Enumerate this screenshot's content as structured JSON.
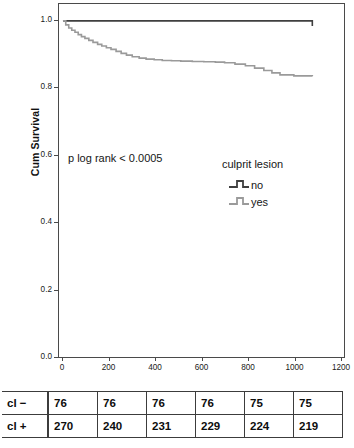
{
  "chart_data": {
    "type": "line",
    "title": "",
    "subtitle": "",
    "xlabel": "",
    "ylabel": "Cum Survival",
    "xlim": [
      0,
      1200
    ],
    "ylim": [
      0.0,
      1.0
    ],
    "x_ticks": [
      0,
      200,
      400,
      600,
      800,
      1000,
      1200
    ],
    "x_tick_labels": [
      "0",
      "200",
      "400",
      "600",
      "800",
      "1000",
      "1200"
    ],
    "y_ticks": [
      0.0,
      0.2,
      0.4,
      0.6,
      0.8,
      1.0
    ],
    "y_tick_labels": [
      "0.0",
      "0.2",
      "0.4",
      "0.6",
      "0.8",
      "1.0"
    ],
    "grid": false,
    "legend_position": "center-right",
    "legend_title": "culprit lesion",
    "annotation": "p log rank < 0.0005",
    "series": [
      {
        "name": "no",
        "color": "#3f3f3f",
        "step": "post",
        "x": [
          0,
          30,
          740,
          1080
        ],
        "y": [
          1.0,
          1.0,
          1.0,
          0.985
        ]
      },
      {
        "name": "yes",
        "color": "#9a9a9a",
        "step": "post",
        "x": [
          0,
          12,
          25,
          38,
          52,
          66,
          80,
          95,
          112,
          130,
          150,
          168,
          188,
          208,
          230,
          252,
          275,
          300,
          330,
          360,
          395,
          430,
          470,
          510,
          560,
          610,
          660,
          700,
          745,
          790,
          830,
          870,
          905,
          940,
          1000,
          1080
        ],
        "y": [
          1.0,
          0.988,
          0.979,
          0.972,
          0.966,
          0.959,
          0.953,
          0.948,
          0.942,
          0.936,
          0.93,
          0.925,
          0.92,
          0.915,
          0.909,
          0.903,
          0.898,
          0.893,
          0.889,
          0.886,
          0.884,
          0.882,
          0.881,
          0.88,
          0.879,
          0.878,
          0.877,
          0.875,
          0.871,
          0.866,
          0.859,
          0.852,
          0.845,
          0.839,
          0.836,
          0.835
        ]
      }
    ]
  },
  "axis": {
    "y_title": "Cum Survival",
    "y_tick_labels": [
      "1.0",
      "0.8",
      "0.6",
      "0.4",
      "0.2",
      "0.0"
    ],
    "x_tick_labels": [
      "0",
      "200",
      "400",
      "600",
      "800",
      "1000",
      "1200"
    ]
  },
  "annotations": {
    "p_value_text": "p log rank < 0.0005"
  },
  "legend": {
    "title": "culprit lesion",
    "items": [
      {
        "label": "no",
        "color": "#3f3f3f"
      },
      {
        "label": "yes",
        "color": "#9a9a9a"
      }
    ]
  },
  "risk_table": {
    "rows": [
      {
        "label": "cl −",
        "values": [
          "76",
          "76",
          "76",
          "76",
          "75",
          "75"
        ]
      },
      {
        "label": "cl +",
        "values": [
          "270",
          "240",
          "231",
          "229",
          "224",
          "219"
        ]
      }
    ]
  },
  "colors": {
    "series_no": "#3f3f3f",
    "series_yes": "#9a9a9a",
    "axis": "#4a4a4a",
    "text": "#111111"
  }
}
